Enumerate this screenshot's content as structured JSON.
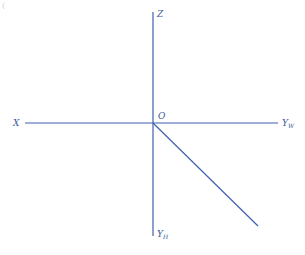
{
  "diagram": {
    "corner_mark": "(",
    "colors": {
      "axis": "#3f5fb0",
      "label": "#3a5a9a",
      "background": "#ffffff"
    },
    "origin": {
      "label": "O",
      "x": 153,
      "y": 123
    },
    "axes": [
      {
        "name": "Z",
        "sub": "",
        "from": [
          153,
          123
        ],
        "to": [
          153,
          12
        ],
        "label_pos": [
          157,
          17
        ]
      },
      {
        "name": "X",
        "sub": "",
        "from": [
          153,
          123
        ],
        "to": [
          25,
          123
        ],
        "label_pos": [
          13,
          126
        ]
      },
      {
        "name": "Y",
        "sub": "W",
        "from": [
          153,
          123
        ],
        "to": [
          278,
          123
        ],
        "label_pos": [
          282,
          126
        ]
      },
      {
        "name": "Y",
        "sub": "H",
        "from": [
          153,
          123
        ],
        "to": [
          153,
          236
        ],
        "label_pos": [
          157,
          237
        ]
      },
      {
        "name": "",
        "sub": "",
        "from": [
          153,
          123
        ],
        "to": [
          258,
          226
        ],
        "label_pos": null
      }
    ]
  }
}
